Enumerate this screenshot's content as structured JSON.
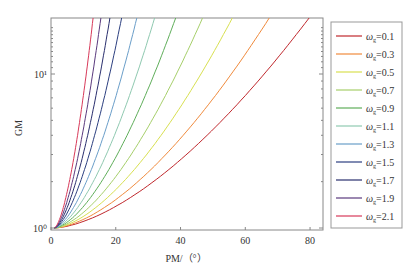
{
  "chart_data": {
    "type": "line",
    "title": "",
    "xlabel": "PM/（°）",
    "ylabel": "GM",
    "xlim": [
      0,
      84
    ],
    "ylim": [
      1,
      23
    ],
    "yscale": "log",
    "xticks": [
      0,
      20,
      40,
      60,
      80
    ],
    "xtick_labels": [
      "0",
      "20",
      "40",
      "60",
      "80"
    ],
    "yticks": [
      1,
      10
    ],
    "ytick_labels": [
      "10⁰",
      "10¹"
    ],
    "grid": false,
    "legend_position": "right, outside plot",
    "series": [
      {
        "name": "ωg=0.1",
        "label_base": "ω",
        "label_sub": "g",
        "label_value": "=0.1",
        "color": "#c0282d",
        "x_at_top": 79.7
      },
      {
        "name": "ωg=0.3",
        "label_base": "ω",
        "label_sub": "g",
        "label_value": "=0.3",
        "color": "#f08a3c",
        "x_at_top": 67.4
      },
      {
        "name": "ωg=0.5",
        "label_base": "ω",
        "label_sub": "g",
        "label_value": "=0.5",
        "color": "#d8e050",
        "x_at_top": 56.0
      },
      {
        "name": "ωg=0.7",
        "label_base": "ω",
        "label_sub": "g",
        "label_value": "=0.7",
        "color": "#a6cf6a",
        "x_at_top": 46.8
      },
      {
        "name": "ωg=0.9",
        "label_base": "ω",
        "label_sub": "g",
        "label_value": "=0.9",
        "color": "#5fae5a",
        "x_at_top": 38.5
      },
      {
        "name": "ωg=1.1",
        "label_base": "ω",
        "label_sub": "g",
        "label_value": "=1.1",
        "color": "#8fc9b0",
        "x_at_top": 32.0
      },
      {
        "name": "ωg=1.3",
        "label_base": "ω",
        "label_sub": "g",
        "label_value": "=1.3",
        "color": "#6a9ec9",
        "x_at_top": 26.5
      },
      {
        "name": "ωg=1.5",
        "label_base": "ω",
        "label_sub": "g",
        "label_value": "=1.5",
        "color": "#2c3f80",
        "x_at_top": 21.8
      },
      {
        "name": "ωg=1.7",
        "label_base": "ω",
        "label_sub": "g",
        "label_value": "=1.7",
        "color": "#2a2f6e",
        "x_at_top": 18.2
      },
      {
        "name": "ωg=1.9",
        "label_base": "ω",
        "label_sub": "g",
        "label_value": "=1.9",
        "color": "#5a3a7e",
        "x_at_top": 15.4
      },
      {
        "name": "ωg=2.1",
        "label_base": "ω",
        "label_sub": "g",
        "label_value": "=2.1",
        "color": "#d83a5a",
        "x_at_top": 13.0
      }
    ],
    "curve_start": {
      "x": 1,
      "y": 1
    }
  }
}
